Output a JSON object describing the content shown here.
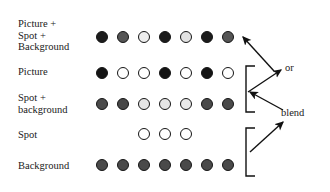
{
  "figure": {
    "title": "",
    "background_color": "#ffffff",
    "text_color": "#1a1a1a",
    "dot_diameter_px": 12,
    "dot_spacing_px": 21,
    "dot_start_x_px": 96
  },
  "rows": [
    {
      "id": "picture-spot-background",
      "label": "Picture +\nSpot +\nBackground",
      "label_x": 18,
      "label_y": 18,
      "dots_y": 31,
      "dots": [
        {
          "index": 0,
          "fill": "#1c1c1c",
          "visible": true
        },
        {
          "index": 1,
          "fill": "#555555",
          "visible": true
        },
        {
          "index": 2,
          "fill": "#eeeeee",
          "visible": true
        },
        {
          "index": 3,
          "fill": "#1c1c1c",
          "visible": true
        },
        {
          "index": 4,
          "fill": "#e2e2e2",
          "visible": true
        },
        {
          "index": 5,
          "fill": "#1c1c1c",
          "visible": true
        },
        {
          "index": 6,
          "fill": "#555555",
          "visible": true
        }
      ]
    },
    {
      "id": "picture",
      "label": "Picture",
      "label_x": 18,
      "label_y": 66,
      "dots_y": 67,
      "dots": [
        {
          "index": 0,
          "fill": "#141414",
          "visible": true
        },
        {
          "index": 1,
          "fill": "#ffffff",
          "visible": true
        },
        {
          "index": 2,
          "fill": "#ffffff",
          "visible": true
        },
        {
          "index": 3,
          "fill": "#141414",
          "visible": true
        },
        {
          "index": 4,
          "fill": "#ffffff",
          "visible": true
        },
        {
          "index": 5,
          "fill": "#141414",
          "visible": true
        },
        {
          "index": 6,
          "fill": "#ffffff",
          "visible": true
        }
      ]
    },
    {
      "id": "spot-plus-background",
      "label": "Spot +\nbackground",
      "label_x": 18,
      "label_y": 92,
      "dots_y": 98,
      "dots": [
        {
          "index": 0,
          "fill": "#4a4a4a",
          "visible": true
        },
        {
          "index": 1,
          "fill": "#474747",
          "visible": true
        },
        {
          "index": 2,
          "fill": "#e6e6e6",
          "visible": true
        },
        {
          "index": 3,
          "fill": "#e6e6e6",
          "visible": true
        },
        {
          "index": 4,
          "fill": "#e9e9e9",
          "visible": true
        },
        {
          "index": 5,
          "fill": "#4a4a4a",
          "visible": true
        },
        {
          "index": 6,
          "fill": "#4a4a4a",
          "visible": true
        }
      ]
    },
    {
      "id": "spot",
      "label": "Spot",
      "label_x": 18,
      "label_y": 129,
      "dots_y": 128,
      "dots": [
        {
          "index": 0,
          "fill": "#ffffff",
          "visible": false
        },
        {
          "index": 1,
          "fill": "#ffffff",
          "visible": false
        },
        {
          "index": 2,
          "fill": "#ffffff",
          "visible": true
        },
        {
          "index": 3,
          "fill": "#ffffff",
          "visible": true
        },
        {
          "index": 4,
          "fill": "#ffffff",
          "visible": true
        },
        {
          "index": 5,
          "fill": "#ffffff",
          "visible": false
        },
        {
          "index": 6,
          "fill": "#ffffff",
          "visible": false
        }
      ]
    },
    {
      "id": "background",
      "label": "Background",
      "label_x": 18,
      "label_y": 160,
      "dots_y": 159,
      "dots": [
        {
          "index": 0,
          "fill": "#4a4a4a",
          "visible": true
        },
        {
          "index": 1,
          "fill": "#4a4a4a",
          "visible": true
        },
        {
          "index": 2,
          "fill": "#4a4a4a",
          "visible": true
        },
        {
          "index": 3,
          "fill": "#4a4a4a",
          "visible": true
        },
        {
          "index": 4,
          "fill": "#4a4a4a",
          "visible": true
        },
        {
          "index": 5,
          "fill": "#4a4a4a",
          "visible": true
        },
        {
          "index": 6,
          "fill": "#4a4a4a",
          "visible": true
        }
      ]
    }
  ],
  "annotations": {
    "or_label": "or",
    "or_label_x": 285,
    "or_label_y": 67,
    "blend_label": "blend",
    "blend_label_x": 281,
    "blend_label_y": 112
  },
  "brackets": [
    {
      "id": "bracket-picture-spotbackground",
      "x": 246,
      "top": 66,
      "bottom": 112,
      "tick": 9
    },
    {
      "id": "bracket-spot-background",
      "x": 246,
      "top": 128,
      "bottom": 176,
      "tick": 9
    }
  ],
  "arrows": [
    {
      "id": "arrow-to-combined-row",
      "from": [
        274,
        71
      ],
      "to": [
        243,
        37
      ]
    },
    {
      "id": "arrow-bracket1-to-or",
      "from": [
        248,
        92
      ],
      "to": [
        281,
        70
      ]
    },
    {
      "id": "arrow-blend-to-bracket1",
      "from": [
        283,
        110
      ],
      "to": [
        250,
        92
      ]
    },
    {
      "id": "arrow-bracket2-to-blend",
      "from": [
        250,
        152
      ],
      "to": [
        283,
        122
      ]
    }
  ]
}
